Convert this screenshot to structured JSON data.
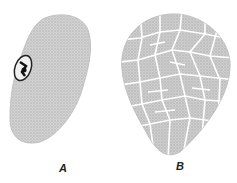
{
  "figure": {
    "panels": [
      {
        "label": "A",
        "description": "granular cell with nucleus at left edge"
      },
      {
        "label": "B",
        "description": "cell divided into reticulated polygonal segments"
      }
    ],
    "colors": {
      "stipple": "#c8c8c8",
      "outline": "#b0b0b0",
      "nucleus": "#2a2a2a",
      "background": "#ffffff"
    }
  }
}
